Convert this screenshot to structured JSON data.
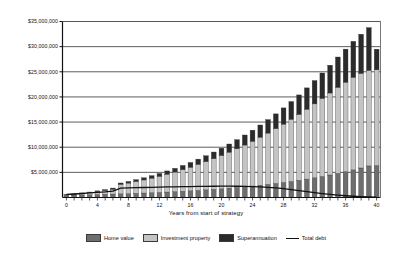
{
  "chart_data": {
    "type": "bar",
    "subtype": "stacked-bar-with-line-overlay",
    "title": "",
    "xlabel": "Years from start of strategy",
    "ylabel": "",
    "xlim": [
      0,
      40
    ],
    "ylim": [
      0,
      35000000
    ],
    "grid": true,
    "grid_axis": "y",
    "legend_position": "bottom",
    "y_tick_labels": [
      "$35,000,000",
      "$30,000,000",
      "$25,000,000",
      "$20,000,000",
      "$15,000,000",
      "$10,000,000",
      "$5,000,000"
    ],
    "y_tick_values": [
      35000000,
      30000000,
      25000000,
      20000000,
      15000000,
      10000000,
      5000000
    ],
    "x_tick_labels": [
      "0",
      "4",
      "8",
      "12",
      "16",
      "20",
      "24",
      "28",
      "32",
      "36",
      "40"
    ],
    "x_tick_values": [
      0,
      4,
      8,
      12,
      16,
      20,
      24,
      28,
      32,
      36,
      40
    ],
    "categories": [
      0,
      1,
      2,
      3,
      4,
      5,
      6,
      7,
      8,
      9,
      10,
      11,
      12,
      13,
      14,
      15,
      16,
      17,
      18,
      19,
      20,
      21,
      22,
      23,
      24,
      25,
      26,
      27,
      28,
      29,
      30,
      31,
      32,
      33,
      34,
      35,
      36,
      37,
      38,
      39,
      40
    ],
    "series": [
      {
        "name": "Home value",
        "type": "bar",
        "stack": "assets",
        "color": "#6e6e6e",
        "values": [
          450000,
          480000,
          515000,
          550000,
          590000,
          630000,
          675000,
          720000,
          770000,
          825000,
          885000,
          945000,
          1010000,
          1080000,
          1160000,
          1240000,
          1325000,
          1420000,
          1520000,
          1625000,
          1740000,
          1860000,
          1990000,
          2130000,
          2280000,
          2440000,
          2610000,
          2790000,
          2990000,
          3200000,
          3420000,
          3660000,
          3920000,
          4190000,
          4480000,
          4800000,
          5130000,
          5490000,
          5870000,
          6280000,
          6350000
        ]
      },
      {
        "name": "Investment property",
        "type": "bar",
        "stack": "assets",
        "color": "#c4c4c4",
        "values": [
          100000,
          180000,
          290000,
          420000,
          580000,
          760000,
          980000,
          1900000,
          2100000,
          2350000,
          2600000,
          2900000,
          3200000,
          3550000,
          3900000,
          4300000,
          4700000,
          5150000,
          5600000,
          6100000,
          6600000,
          7150000,
          7700000,
          8300000,
          8900000,
          9550000,
          10200000,
          10900000,
          11600000,
          12350000,
          13100000,
          13900000,
          14700000,
          15500000,
          16300000,
          17100000,
          17800000,
          18400000,
          18800000,
          19000000,
          19050000
        ]
      },
      {
        "name": "Superannuation",
        "type": "bar",
        "stack": "assets",
        "color": "#2b2b2b",
        "values": [
          50000,
          70000,
          95000,
          120000,
          150000,
          185000,
          225000,
          270000,
          320000,
          375000,
          435000,
          500000,
          575000,
          655000,
          745000,
          840000,
          945000,
          1060000,
          1185000,
          1320000,
          1470000,
          1630000,
          1810000,
          2000000,
          2210000,
          2430000,
          2680000,
          2940000,
          3230000,
          3540000,
          3880000,
          4240000,
          4640000,
          5070000,
          5530000,
          6040000,
          6580000,
          7170000,
          7800000,
          8500000,
          4100000
        ]
      },
      {
        "name": "Total debt",
        "type": "line",
        "color": "#111111",
        "values": [
          600000,
          700000,
          800000,
          900000,
          1000000,
          1100000,
          1250000,
          1850000,
          1900000,
          1950000,
          1990000,
          2030000,
          2070000,
          2100000,
          2130000,
          2160000,
          2180000,
          2200000,
          2220000,
          2240000,
          2250000,
          2250000,
          2240000,
          2220000,
          2180000,
          2120000,
          2030000,
          1900000,
          1750000,
          1570000,
          1380000,
          1180000,
          980000,
          790000,
          620000,
          470000,
          350000,
          250000,
          170000,
          100000,
          50000
        ]
      }
    ],
    "legend": [
      {
        "label": "Home value",
        "color": "#6e6e6e",
        "marker": "swatch"
      },
      {
        "label": "Investment property",
        "color": "#c4c4c4",
        "marker": "swatch"
      },
      {
        "label": "Superannuation",
        "color": "#2b2b2b",
        "marker": "swatch"
      },
      {
        "label": "Total debt",
        "color": "#111111",
        "marker": "line"
      }
    ]
  },
  "axis": {
    "x_title": "Years from start of strategy"
  }
}
